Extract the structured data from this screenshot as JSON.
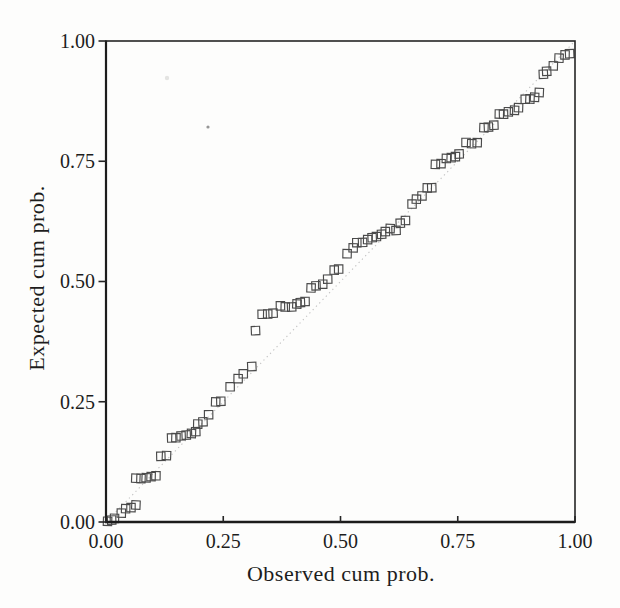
{
  "figure": {
    "title": "",
    "background_color": "#fdfdfc"
  },
  "chart_data": {
    "type": "scatter",
    "title": "",
    "xlabel": "Observed cum prob.",
    "ylabel": "Expected cum prob.",
    "xlim": [
      0,
      1
    ],
    "ylim": [
      0,
      1
    ],
    "grid": false,
    "legend": "none",
    "tick_values": [
      0,
      0.25,
      0.5,
      0.75,
      1
    ],
    "x_tick_labels": [
      "0.00",
      "0.25",
      "0.50",
      "0.75",
      "1.00"
    ],
    "y_tick_labels": [
      "0.00",
      "0.25",
      "0.50",
      "0.75",
      "1.00"
    ],
    "marker": {
      "shape": "open-square",
      "size_px": 8.4,
      "stroke_color": "#4a4a4a"
    },
    "reference_line": {
      "type": "identity",
      "from": [
        0,
        0
      ],
      "to": [
        1,
        1
      ],
      "style": "dotted",
      "color": "#c3c3c3"
    },
    "colors": {
      "axis": "#252525",
      "text": "#1d1d1d"
    },
    "series": [
      {
        "name": "pp-points",
        "points": [
          [
            0.004,
            0.002
          ],
          [
            0.011,
            0.004
          ],
          [
            0.019,
            0.008
          ],
          [
            0.032,
            0.019
          ],
          [
            0.043,
            0.027
          ],
          [
            0.053,
            0.031
          ],
          [
            0.064,
            0.035
          ],
          [
            0.064,
            0.091
          ],
          [
            0.075,
            0.091
          ],
          [
            0.085,
            0.093
          ],
          [
            0.096,
            0.095
          ],
          [
            0.107,
            0.097
          ],
          [
            0.118,
            0.136
          ],
          [
            0.13,
            0.137
          ],
          [
            0.139,
            0.174
          ],
          [
            0.15,
            0.176
          ],
          [
            0.16,
            0.178
          ],
          [
            0.171,
            0.18
          ],
          [
            0.182,
            0.184
          ],
          [
            0.192,
            0.188
          ],
          [
            0.196,
            0.203
          ],
          [
            0.206,
            0.209
          ],
          [
            0.22,
            0.224
          ],
          [
            0.233,
            0.25
          ],
          [
            0.246,
            0.25
          ],
          [
            0.265,
            0.28
          ],
          [
            0.282,
            0.298
          ],
          [
            0.293,
            0.309
          ],
          [
            0.31,
            0.323
          ],
          [
            0.318,
            0.397
          ],
          [
            0.333,
            0.431
          ],
          [
            0.344,
            0.433
          ],
          [
            0.355,
            0.435
          ],
          [
            0.372,
            0.449
          ],
          [
            0.383,
            0.447
          ],
          [
            0.395,
            0.447
          ],
          [
            0.406,
            0.452
          ],
          [
            0.415,
            0.456
          ],
          [
            0.425,
            0.458
          ],
          [
            0.438,
            0.487
          ],
          [
            0.449,
            0.491
          ],
          [
            0.462,
            0.495
          ],
          [
            0.472,
            0.505
          ],
          [
            0.487,
            0.524
          ],
          [
            0.496,
            0.526
          ],
          [
            0.515,
            0.557
          ],
          [
            0.526,
            0.571
          ],
          [
            0.536,
            0.58
          ],
          [
            0.547,
            0.582
          ],
          [
            0.558,
            0.586
          ],
          [
            0.568,
            0.592
          ],
          [
            0.577,
            0.594
          ],
          [
            0.588,
            0.598
          ],
          [
            0.596,
            0.605
          ],
          [
            0.607,
            0.609
          ],
          [
            0.618,
            0.605
          ],
          [
            0.628,
            0.621
          ],
          [
            0.639,
            0.627
          ],
          [
            0.652,
            0.66
          ],
          [
            0.662,
            0.671
          ],
          [
            0.675,
            0.677
          ],
          [
            0.686,
            0.694
          ],
          [
            0.694,
            0.694
          ],
          [
            0.703,
            0.743
          ],
          [
            0.714,
            0.745
          ],
          [
            0.726,
            0.756
          ],
          [
            0.737,
            0.758
          ],
          [
            0.746,
            0.76
          ],
          [
            0.754,
            0.764
          ],
          [
            0.767,
            0.789
          ],
          [
            0.78,
            0.787
          ],
          [
            0.791,
            0.789
          ],
          [
            0.806,
            0.82
          ],
          [
            0.816,
            0.822
          ],
          [
            0.827,
            0.826
          ],
          [
            0.838,
            0.847
          ],
          [
            0.848,
            0.849
          ],
          [
            0.859,
            0.853
          ],
          [
            0.87,
            0.857
          ],
          [
            0.88,
            0.861
          ],
          [
            0.893,
            0.88
          ],
          [
            0.904,
            0.88
          ],
          [
            0.915,
            0.882
          ],
          [
            0.925,
            0.892
          ],
          [
            0.932,
            0.932
          ],
          [
            0.94,
            0.936
          ],
          [
            0.953,
            0.948
          ],
          [
            0.966,
            0.965
          ],
          [
            0.979,
            0.971
          ],
          [
            0.989,
            0.973
          ]
        ]
      }
    ],
    "artifacts": [
      {
        "x_px": 208,
        "y_px": 127,
        "radius_px": 1.6,
        "color": "#969696"
      },
      {
        "x_px": 167,
        "y_px": 78,
        "radius_px": 2.2,
        "color": "#e4e4e2"
      }
    ]
  }
}
